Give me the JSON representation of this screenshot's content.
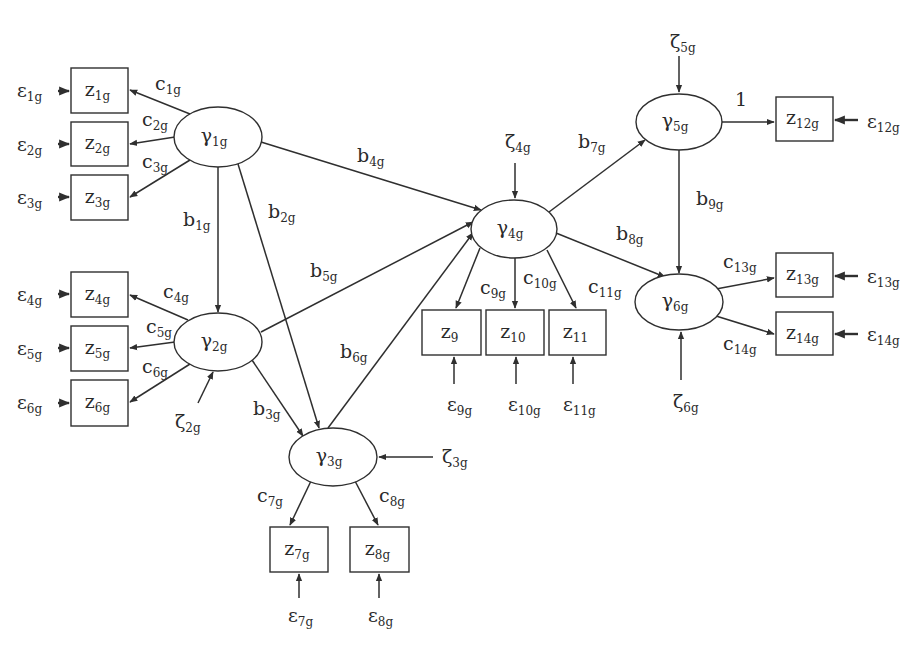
{
  "diagram": {
    "type": "structural-equation-model",
    "colors": {
      "line": "#2f2f2f",
      "text": "#2a2a2a",
      "background": "#ffffff"
    },
    "latent_nodes": [
      {
        "id": "gamma1",
        "symbol": "γ",
        "sub": "1g",
        "cx": 218,
        "cy": 137,
        "rx": 44,
        "ry": 30
      },
      {
        "id": "gamma2",
        "symbol": "γ",
        "sub": "2g",
        "cx": 218,
        "cy": 342,
        "rx": 44,
        "ry": 29
      },
      {
        "id": "gamma3",
        "symbol": "γ",
        "sub": "3g",
        "cx": 333,
        "cy": 457,
        "rx": 44,
        "ry": 29
      },
      {
        "id": "gamma4",
        "symbol": "γ",
        "sub": "4g",
        "cx": 514,
        "cy": 229,
        "rx": 43,
        "ry": 29
      },
      {
        "id": "gamma5",
        "symbol": "γ",
        "sub": "5g",
        "cx": 679,
        "cy": 122,
        "rx": 43,
        "ry": 28
      },
      {
        "id": "gamma6",
        "symbol": "γ",
        "sub": "6g",
        "cx": 679,
        "cy": 302,
        "rx": 44,
        "ry": 28
      }
    ],
    "observed_nodes": [
      {
        "id": "z1",
        "symbol": "z",
        "sub": "1g",
        "x": 71,
        "y": 68,
        "w": 57,
        "h": 45
      },
      {
        "id": "z2",
        "symbol": "z",
        "sub": "2g",
        "x": 71,
        "y": 122,
        "w": 57,
        "h": 44
      },
      {
        "id": "z3",
        "symbol": "z",
        "sub": "3g",
        "x": 71,
        "y": 175,
        "w": 57,
        "h": 45
      },
      {
        "id": "z4",
        "symbol": "z",
        "sub": "4g",
        "x": 71,
        "y": 272,
        "w": 57,
        "h": 45
      },
      {
        "id": "z5",
        "symbol": "z",
        "sub": "5g",
        "x": 71,
        "y": 326,
        "w": 57,
        "h": 45
      },
      {
        "id": "z6",
        "symbol": "z",
        "sub": "6g",
        "x": 71,
        "y": 380,
        "w": 57,
        "h": 46
      },
      {
        "id": "z7",
        "symbol": "z",
        "sub": "7g",
        "x": 270,
        "y": 527,
        "w": 58,
        "h": 45
      },
      {
        "id": "z8",
        "symbol": "z",
        "sub": "8g",
        "x": 350,
        "y": 527,
        "w": 59,
        "h": 45
      },
      {
        "id": "z9",
        "symbol": "z",
        "sub": "9",
        "x": 422,
        "y": 310,
        "w": 59,
        "h": 45
      },
      {
        "id": "z10",
        "symbol": "z",
        "sub": "10",
        "x": 486,
        "y": 310,
        "w": 58,
        "h": 45
      },
      {
        "id": "z11",
        "symbol": "z",
        "sub": "11",
        "x": 549,
        "y": 310,
        "w": 57,
        "h": 45
      },
      {
        "id": "z12",
        "symbol": "z",
        "sub": "12g",
        "x": 776,
        "y": 97,
        "w": 57,
        "h": 44
      },
      {
        "id": "z13",
        "symbol": "z",
        "sub": "13g",
        "x": 776,
        "y": 253,
        "w": 57,
        "h": 44
      },
      {
        "id": "z14",
        "symbol": "z",
        "sub": "14g",
        "x": 776,
        "y": 312,
        "w": 57,
        "h": 43
      }
    ],
    "edges": [
      {
        "from": "gamma1",
        "to": "z1",
        "x1": 190,
        "y1": 114,
        "x2": 130,
        "y2": 90,
        "label": {
          "symbol": "c",
          "sub": "1g",
          "x": 155,
          "y": 90
        }
      },
      {
        "from": "gamma1",
        "to": "z2",
        "x1": 175,
        "y1": 137,
        "x2": 130,
        "y2": 144,
        "label": {
          "symbol": "c",
          "sub": "2g",
          "x": 142,
          "y": 126
        }
      },
      {
        "from": "gamma1",
        "to": "z3",
        "x1": 190,
        "y1": 160,
        "x2": 130,
        "y2": 197,
        "label": {
          "symbol": "c",
          "sub": "3g",
          "x": 142,
          "y": 168
        }
      },
      {
        "from": "gamma2",
        "to": "z4",
        "x1": 188,
        "y1": 320,
        "x2": 130,
        "y2": 295,
        "label": {
          "symbol": "c",
          "sub": "4g",
          "x": 163,
          "y": 298
        }
      },
      {
        "from": "gamma2",
        "to": "z5",
        "x1": 175,
        "y1": 342,
        "x2": 130,
        "y2": 348,
        "label": {
          "symbol": "c",
          "sub": "5g",
          "x": 146,
          "y": 333
        }
      },
      {
        "from": "gamma2",
        "to": "z6",
        "x1": 190,
        "y1": 364,
        "x2": 130,
        "y2": 402,
        "label": {
          "symbol": "c",
          "sub": "6g",
          "x": 142,
          "y": 373
        }
      },
      {
        "from": "gamma1",
        "to": "gamma2",
        "x1": 218,
        "y1": 167,
        "x2": 218,
        "y2": 312,
        "label": {
          "symbol": "b",
          "sub": "1g",
          "x": 183,
          "y": 226
        }
      },
      {
        "from": "gamma1",
        "to": "gamma3",
        "x1": 238,
        "y1": 164,
        "x2": 319,
        "y2": 428,
        "label": {
          "symbol": "b",
          "sub": "2g",
          "x": 268,
          "y": 218
        }
      },
      {
        "from": "gamma2",
        "to": "gamma3",
        "x1": 252,
        "y1": 360,
        "x2": 303,
        "y2": 436,
        "label": {
          "symbol": "b",
          "sub": "3g",
          "x": 253,
          "y": 415
        }
      },
      {
        "from": "gamma1",
        "to": "gamma4",
        "x1": 261,
        "y1": 142,
        "x2": 481,
        "y2": 210,
        "label": {
          "symbol": "b",
          "sub": "4g",
          "x": 357,
          "y": 162
        }
      },
      {
        "from": "gamma2",
        "to": "gamma4",
        "x1": 261,
        "y1": 332,
        "x2": 473,
        "y2": 222,
        "label": {
          "symbol": "b",
          "sub": "5g",
          "x": 310,
          "y": 277
        }
      },
      {
        "from": "gamma3",
        "to": "gamma4",
        "x1": 328,
        "y1": 428,
        "x2": 473,
        "y2": 233,
        "label": {
          "symbol": "b",
          "sub": "6g",
          "x": 340,
          "y": 358
        }
      },
      {
        "from": "gamma4",
        "to": "gamma5",
        "x1": 549,
        "y1": 212,
        "x2": 645,
        "y2": 140,
        "label": {
          "symbol": "b",
          "sub": "7g",
          "x": 578,
          "y": 148
        }
      },
      {
        "from": "gamma4",
        "to": "gamma6",
        "x1": 556,
        "y1": 233,
        "x2": 665,
        "y2": 277,
        "label": {
          "symbol": "b",
          "sub": "8g",
          "x": 616,
          "y": 240
        }
      },
      {
        "from": "gamma5",
        "to": "gamma6",
        "x1": 679,
        "y1": 150,
        "x2": 679,
        "y2": 273,
        "label": {
          "symbol": "b",
          "sub": "9g",
          "x": 696,
          "y": 205
        }
      },
      {
        "from": "gamma4",
        "to": "z9",
        "x1": 480,
        "y1": 248,
        "x2": 456,
        "y2": 308,
        "label": {
          "symbol": "c",
          "sub": "9g",
          "x": 480,
          "y": 294
        }
      },
      {
        "from": "gamma4",
        "to": "z10",
        "x1": 515,
        "y1": 258,
        "x2": 515,
        "y2": 308,
        "label": {
          "symbol": "c",
          "sub": "10g",
          "x": 523,
          "y": 284
        }
      },
      {
        "from": "gamma4",
        "to": "z11",
        "x1": 547,
        "y1": 250,
        "x2": 576,
        "y2": 308,
        "label": {
          "symbol": "c",
          "sub": "11g",
          "x": 588,
          "y": 293
        }
      },
      {
        "from": "gamma5",
        "to": "z12",
        "x1": 722,
        "y1": 122,
        "x2": 774,
        "y2": 122,
        "label": {
          "symbol": "1",
          "sub": "",
          "x": 735,
          "y": 106
        }
      },
      {
        "from": "gamma6",
        "to": "z13",
        "x1": 716,
        "y1": 289,
        "x2": 774,
        "y2": 278,
        "label": {
          "symbol": "c",
          "sub": "13g",
          "x": 723,
          "y": 268
        }
      },
      {
        "from": "gamma6",
        "to": "z14",
        "x1": 716,
        "y1": 316,
        "x2": 774,
        "y2": 334,
        "label": {
          "symbol": "c",
          "sub": "14g",
          "x": 723,
          "y": 350
        }
      },
      {
        "from": "gamma3",
        "to": "z7",
        "x1": 311,
        "y1": 481,
        "x2": 290,
        "y2": 525,
        "label": {
          "symbol": "c",
          "sub": "7g",
          "x": 257,
          "y": 502
        }
      },
      {
        "from": "gamma3",
        "to": "z8",
        "x1": 355,
        "y1": 481,
        "x2": 378,
        "y2": 525,
        "label": {
          "symbol": "c",
          "sub": "8g",
          "x": 379,
          "y": 502
        }
      }
    ],
    "error_terms": [
      {
        "symbol": "ε",
        "sub": "1g",
        "tx": 17,
        "ty": 97,
        "x1": 58,
        "y1": 91,
        "x2": 69,
        "y2": 91,
        "thick": true
      },
      {
        "symbol": "ε",
        "sub": "2g",
        "tx": 17,
        "ty": 151,
        "x1": 58,
        "y1": 144,
        "x2": 69,
        "y2": 144,
        "thick": true
      },
      {
        "symbol": "ε",
        "sub": "3g",
        "tx": 17,
        "ty": 204,
        "x1": 58,
        "y1": 197,
        "x2": 69,
        "y2": 197,
        "thick": true
      },
      {
        "symbol": "ε",
        "sub": "4g",
        "tx": 17,
        "ty": 301,
        "x1": 58,
        "y1": 294,
        "x2": 69,
        "y2": 294,
        "thick": true
      },
      {
        "symbol": "ε",
        "sub": "5g",
        "tx": 17,
        "ty": 355,
        "x1": 58,
        "y1": 348,
        "x2": 69,
        "y2": 348,
        "thick": true
      },
      {
        "symbol": "ε",
        "sub": "6g",
        "tx": 17,
        "ty": 409,
        "x1": 58,
        "y1": 403,
        "x2": 69,
        "y2": 403,
        "thick": true
      },
      {
        "symbol": "ε",
        "sub": "7g",
        "tx": 288,
        "ty": 622,
        "x1": 299,
        "y1": 598,
        "x2": 299,
        "y2": 574,
        "thick": false
      },
      {
        "symbol": "ε",
        "sub": "8g",
        "tx": 368,
        "ty": 622,
        "x1": 379,
        "y1": 598,
        "x2": 379,
        "y2": 574,
        "thick": false
      },
      {
        "symbol": "ε",
        "sub": "9g",
        "tx": 447,
        "ty": 411,
        "x1": 454,
        "y1": 384,
        "x2": 454,
        "y2": 357,
        "thick": false
      },
      {
        "symbol": "ε",
        "sub": "10g",
        "tx": 508,
        "ty": 411,
        "x1": 516,
        "y1": 384,
        "x2": 516,
        "y2": 357,
        "thick": false
      },
      {
        "symbol": "ε",
        "sub": "11g",
        "tx": 563,
        "ty": 411,
        "x1": 573,
        "y1": 384,
        "x2": 573,
        "y2": 357,
        "thick": false
      },
      {
        "symbol": "ε",
        "sub": "12g",
        "tx": 867,
        "ty": 128,
        "x1": 858,
        "y1": 120,
        "x2": 835,
        "y2": 120,
        "thick": true
      },
      {
        "symbol": "ε",
        "sub": "13g",
        "tx": 867,
        "ty": 283,
        "x1": 858,
        "y1": 276,
        "x2": 835,
        "y2": 276,
        "thick": true
      },
      {
        "symbol": "ε",
        "sub": "14g",
        "tx": 867,
        "ty": 341,
        "x1": 858,
        "y1": 334,
        "x2": 835,
        "y2": 334,
        "thick": true
      }
    ],
    "disturbance_terms": [
      {
        "symbol": "ζ",
        "sub": "2g",
        "tx": 175,
        "ty": 428,
        "x1": 198,
        "y1": 403,
        "x2": 213,
        "y2": 372
      },
      {
        "symbol": "ζ",
        "sub": "3g",
        "tx": 442,
        "ty": 463,
        "x1": 433,
        "y1": 457,
        "x2": 379,
        "y2": 457
      },
      {
        "symbol": "ζ",
        "sub": "4g",
        "tx": 505,
        "ty": 148,
        "x1": 515,
        "y1": 163,
        "x2": 515,
        "y2": 198
      },
      {
        "symbol": "ζ",
        "sub": "5g",
        "tx": 670,
        "ty": 48,
        "x1": 679,
        "y1": 56,
        "x2": 679,
        "y2": 92
      },
      {
        "symbol": "ζ",
        "sub": "6g",
        "tx": 673,
        "ty": 408,
        "x1": 681,
        "y1": 380,
        "x2": 681,
        "y2": 332
      }
    ]
  }
}
